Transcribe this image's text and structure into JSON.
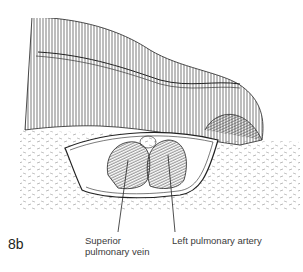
{
  "figure": {
    "number": "8b",
    "labels": [
      {
        "id": "superior-pulmonary-vein",
        "line1": "Superior",
        "line2": "pulmonary vein"
      },
      {
        "id": "left-pulmonary-artery",
        "line1": "Left pulmonary artery"
      }
    ],
    "colors": {
      "ink": "#231f20",
      "background": "#ffffff"
    }
  }
}
